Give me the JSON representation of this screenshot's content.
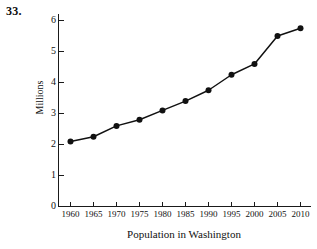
{
  "figure": {
    "problem_number": "33.",
    "background_color": "#ffffff",
    "ink_color": "#111111"
  },
  "chart_data": {
    "type": "line",
    "title": "",
    "subtitle": "",
    "xlabel": "Population in Washington",
    "ylabel": "Millions",
    "categories": [
      "1960",
      "1965",
      "1970",
      "1975",
      "1980",
      "1985",
      "1990",
      "1995",
      "2000",
      "2005",
      "2010"
    ],
    "x": [
      1960,
      1965,
      1970,
      1975,
      1980,
      1985,
      1990,
      1995,
      2000,
      2005,
      2010
    ],
    "values": [
      2.1,
      2.25,
      2.6,
      2.8,
      3.1,
      3.4,
      3.75,
      4.25,
      4.6,
      5.5,
      5.75
    ],
    "series": [
      {
        "name": "Population in Washington",
        "values": [
          2.1,
          2.25,
          2.6,
          2.8,
          3.1,
          3.4,
          3.75,
          4.25,
          4.6,
          5.5,
          5.75
        ]
      }
    ],
    "xlim": [
      1957.5,
      2012.5
    ],
    "ylim": [
      0,
      6.3
    ],
    "ytick_labels": [
      "0",
      "1",
      "2",
      "3",
      "4",
      "5",
      "6"
    ],
    "ytick_values": [
      0,
      1,
      2,
      3,
      4,
      5,
      6
    ],
    "xtick_labels": [
      "1960",
      "1965",
      "1970",
      "1975",
      "1980",
      "1985",
      "1990",
      "1995",
      "2000",
      "2005",
      "2010"
    ],
    "grid": false,
    "legend": false,
    "legend_position": "none",
    "marker": "filled-circle",
    "line_color": "#111111",
    "marker_color": "#111111",
    "annotations": []
  }
}
